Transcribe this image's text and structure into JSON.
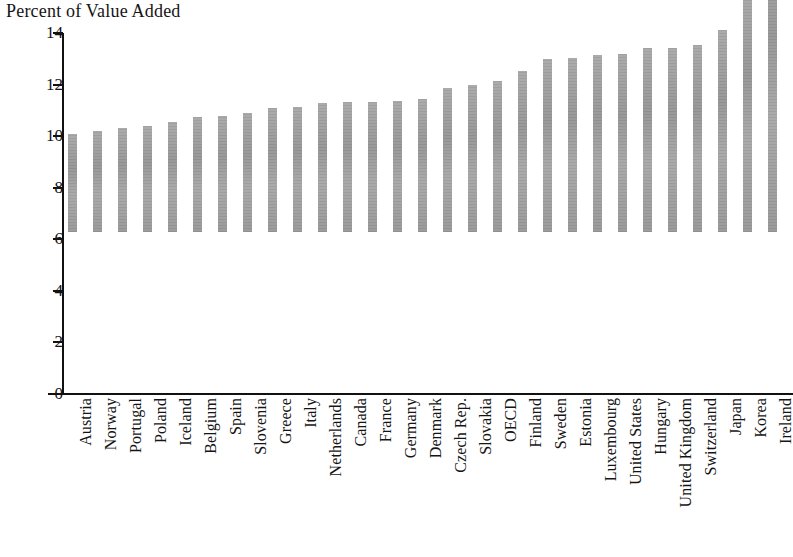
{
  "chart_data": {
    "type": "bar",
    "title": "Percent of Value Added",
    "xlabel": "",
    "ylabel": "",
    "ylim": [
      0,
      14
    ],
    "yticks": [
      0,
      2,
      4,
      6,
      8,
      10,
      12,
      14
    ],
    "grid": false,
    "legend": null,
    "bar_color": "#9d9d9d",
    "axis_color": "#111111",
    "orientation": "vertical",
    "sorted": "ascending",
    "categories": [
      "Austria",
      "Norway",
      "Portugal",
      "Poland",
      "Iceland",
      "Belgium",
      "Spain",
      "Slovenia",
      "Greece",
      "Italy",
      "Netherlands",
      "Canada",
      "France",
      "Germany",
      "Denmark",
      "Czech Rep.",
      "Slovakia",
      "OECD",
      "Finland",
      "Sweden",
      "Estonia",
      "Luxembourg",
      "United States",
      "Hungary",
      "United Kingdom",
      "Switzerland",
      "Japan",
      "Korea",
      "Ireland"
    ],
    "values": [
      3.8,
      3.9,
      4.05,
      4.1,
      4.25,
      4.45,
      4.5,
      4.6,
      4.8,
      4.85,
      5.0,
      5.05,
      5.05,
      5.1,
      5.15,
      5.6,
      5.7,
      5.85,
      6.25,
      6.7,
      6.75,
      6.85,
      6.9,
      7.15,
      7.15,
      7.25,
      7.85,
      9.35,
      11.7
    ]
  }
}
